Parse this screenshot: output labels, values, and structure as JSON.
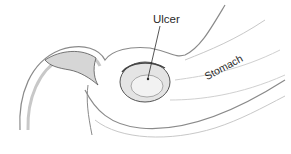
{
  "figure": {
    "style": "pencil sketch, grayscale",
    "labels": [
      {
        "id": "ulcer",
        "text": "Ulcer"
      },
      {
        "id": "stomach",
        "text": "Stomach"
      }
    ]
  },
  "colors": {
    "background": "#ffffff",
    "ink": "#2a2a2a",
    "shading_dark": "#555555",
    "shading_mid": "#8a8a8a",
    "shading_light": "#c8c8c8"
  }
}
